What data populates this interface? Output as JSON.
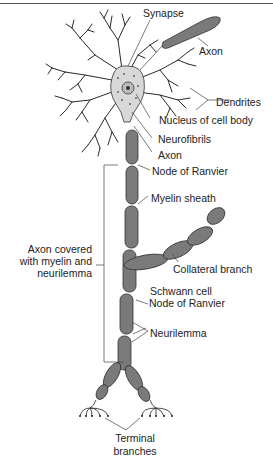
{
  "diagram": {
    "colors": {
      "axon_fill": "#7a7a7a",
      "axon_stroke": "#333333",
      "cell_body": "#d8d8d8",
      "dendrite": "#2a2a2a",
      "leader": "#444444",
      "text": "#222222"
    },
    "labels": {
      "synapse": "Synapse",
      "axon_top": "Axon",
      "dendrites": "Dendrites",
      "nucleus": "Nucleus of cell body",
      "neurofibrils": "Neurofibrils",
      "axon": "Axon",
      "node1": "Node of Ranvier",
      "myelin": "Myelin sheath",
      "axon_covered_1": "Axon covered",
      "axon_covered_2": "with myelin and",
      "axon_covered_3": "neurilemma",
      "collateral": "Collateral branch",
      "schwann": "Schwann cell",
      "node2": "Node of Ranvier",
      "neurilemma": "Neurilemma",
      "terminal_1": "Terminal",
      "terminal_2": "branches"
    }
  }
}
